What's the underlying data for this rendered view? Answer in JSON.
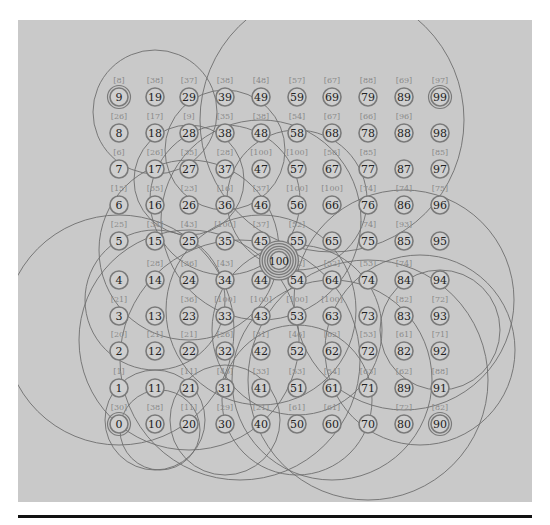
{
  "figure": {
    "background": "#c9c9c9",
    "line_color": "#6e6e6e",
    "node_ring_color": "#7a7a7a",
    "label_color": "#8a8a8a",
    "text_color": "#222222",
    "center_node": {
      "id": "100",
      "col": 4.5,
      "row": 4.5,
      "rings": 4
    },
    "double_ring_nodes": [
      "9",
      "99",
      "0",
      "90"
    ],
    "columns_x": [
      119,
      155,
      189,
      225,
      261,
      297,
      332,
      368,
      404,
      440
    ],
    "rows_y": [
      424,
      388,
      351,
      316,
      280,
      241,
      205,
      169,
      133,
      97
    ],
    "nodes": [
      {
        "id": "9",
        "col": 0,
        "row": 9,
        "label": "[8]"
      },
      {
        "id": "19",
        "col": 1,
        "row": 9,
        "label": "[38]"
      },
      {
        "id": "29",
        "col": 2,
        "row": 9,
        "label": "[37]"
      },
      {
        "id": "39",
        "col": 3,
        "row": 9,
        "label": "[38]"
      },
      {
        "id": "49",
        "col": 4,
        "row": 9,
        "label": "[48]"
      },
      {
        "id": "59",
        "col": 5,
        "row": 9,
        "label": "[57]"
      },
      {
        "id": "69",
        "col": 6,
        "row": 9,
        "label": "[67]"
      },
      {
        "id": "79",
        "col": 7,
        "row": 9,
        "label": "[88]"
      },
      {
        "id": "89",
        "col": 8,
        "row": 9,
        "label": "[69]"
      },
      {
        "id": "99",
        "col": 9,
        "row": 9,
        "label": "[97]"
      },
      {
        "id": "8",
        "col": 0,
        "row": 8,
        "label": "[26]"
      },
      {
        "id": "18",
        "col": 1,
        "row": 8,
        "label": "[17]"
      },
      {
        "id": "28",
        "col": 2,
        "row": 8,
        "label": "[9]"
      },
      {
        "id": "38",
        "col": 3,
        "row": 8,
        "label": "[35]"
      },
      {
        "id": "48",
        "col": 4,
        "row": 8,
        "label": "[38]"
      },
      {
        "id": "58",
        "col": 5,
        "row": 8,
        "label": "[54]"
      },
      {
        "id": "68",
        "col": 6,
        "row": 8,
        "label": "[67]"
      },
      {
        "id": "78",
        "col": 7,
        "row": 8,
        "label": "[66]"
      },
      {
        "id": "88",
        "col": 8,
        "row": 8,
        "label": "[96]"
      },
      {
        "id": "98",
        "col": 9,
        "row": 8,
        "label": ""
      },
      {
        "id": "7",
        "col": 0,
        "row": 7,
        "label": "[6]"
      },
      {
        "id": "17",
        "col": 1,
        "row": 7,
        "label": "[26]"
      },
      {
        "id": "27",
        "col": 2,
        "row": 7,
        "label": "[35]"
      },
      {
        "id": "37",
        "col": 3,
        "row": 7,
        "label": "[28]"
      },
      {
        "id": "47",
        "col": 4,
        "row": 7,
        "label": "[100]"
      },
      {
        "id": "57",
        "col": 5,
        "row": 7,
        "label": "[100]"
      },
      {
        "id": "67",
        "col": 6,
        "row": 7,
        "label": "[56]"
      },
      {
        "id": "77",
        "col": 7,
        "row": 7,
        "label": "[85]"
      },
      {
        "id": "87",
        "col": 8,
        "row": 7,
        "label": ""
      },
      {
        "id": "97",
        "col": 9,
        "row": 7,
        "label": "[85]"
      },
      {
        "id": "6",
        "col": 0,
        "row": 6,
        "label": "[15]"
      },
      {
        "id": "16",
        "col": 1,
        "row": 6,
        "label": "[35]"
      },
      {
        "id": "26",
        "col": 2,
        "row": 6,
        "label": "[23]"
      },
      {
        "id": "36",
        "col": 3,
        "row": 6,
        "label": "[16]"
      },
      {
        "id": "46",
        "col": 4,
        "row": 6,
        "label": "[37]"
      },
      {
        "id": "56",
        "col": 5,
        "row": 6,
        "label": "[100]"
      },
      {
        "id": "66",
        "col": 6,
        "row": 6,
        "label": "[100]"
      },
      {
        "id": "76",
        "col": 7,
        "row": 6,
        "label": "[74]"
      },
      {
        "id": "86",
        "col": 8,
        "row": 6,
        "label": "[74]"
      },
      {
        "id": "96",
        "col": 9,
        "row": 6,
        "label": "[75]"
      },
      {
        "id": "5",
        "col": 0,
        "row": 5,
        "label": "[25]"
      },
      {
        "id": "15",
        "col": 1,
        "row": 5,
        "label": "[34]"
      },
      {
        "id": "25",
        "col": 2,
        "row": 5,
        "label": "[43]"
      },
      {
        "id": "35",
        "col": 3,
        "row": 5,
        "label": "[100]"
      },
      {
        "id": "45",
        "col": 4,
        "row": 5,
        "label": "[37]"
      },
      {
        "id": "55",
        "col": 5,
        "row": 5,
        "label": "[52]"
      },
      {
        "id": "65",
        "col": 6,
        "row": 5,
        "label": ""
      },
      {
        "id": "75",
        "col": 7,
        "row": 5,
        "label": "[74]"
      },
      {
        "id": "85",
        "col": 8,
        "row": 5,
        "label": "[93]"
      },
      {
        "id": "95",
        "col": 9,
        "row": 5,
        "label": ""
      },
      {
        "id": "4",
        "col": 0,
        "row": 4,
        "label": ""
      },
      {
        "id": "14",
        "col": 1,
        "row": 4,
        "label": "[28]"
      },
      {
        "id": "24",
        "col": 2,
        "row": 4,
        "label": "[36]"
      },
      {
        "id": "34",
        "col": 3,
        "row": 4,
        "label": "[43]"
      },
      {
        "id": "44",
        "col": 4,
        "row": 4,
        "label": ""
      },
      {
        "id": "54",
        "col": 5,
        "row": 4,
        "label": "[52]"
      },
      {
        "id": "64",
        "col": 6,
        "row": 4,
        "label": "[52]"
      },
      {
        "id": "74",
        "col": 7,
        "row": 4,
        "label": "[53]"
      },
      {
        "id": "84",
        "col": 8,
        "row": 4,
        "label": "[74]"
      },
      {
        "id": "94",
        "col": 9,
        "row": 4,
        "label": ""
      },
      {
        "id": "3",
        "col": 0,
        "row": 3,
        "label": "[21]"
      },
      {
        "id": "13",
        "col": 1,
        "row": 3,
        "label": ""
      },
      {
        "id": "23",
        "col": 2,
        "row": 3,
        "label": "[36]"
      },
      {
        "id": "33",
        "col": 3,
        "row": 3,
        "label": "[100]"
      },
      {
        "id": "43",
        "col": 4,
        "row": 3,
        "label": "[100]"
      },
      {
        "id": "53",
        "col": 5,
        "row": 3,
        "label": "[100]"
      },
      {
        "id": "63",
        "col": 6,
        "row": 3,
        "label": "[100]"
      },
      {
        "id": "73",
        "col": 7,
        "row": 3,
        "label": ""
      },
      {
        "id": "83",
        "col": 8,
        "row": 3,
        "label": "[82]"
      },
      {
        "id": "93",
        "col": 9,
        "row": 3,
        "label": "[72]"
      },
      {
        "id": "2",
        "col": 0,
        "row": 2,
        "label": "[20]"
      },
      {
        "id": "12",
        "col": 1,
        "row": 2,
        "label": "[21]"
      },
      {
        "id": "22",
        "col": 2,
        "row": 2,
        "label": "[21]"
      },
      {
        "id": "32",
        "col": 3,
        "row": 2,
        "label": "[26]"
      },
      {
        "id": "42",
        "col": 4,
        "row": 2,
        "label": "[31]"
      },
      {
        "id": "52",
        "col": 5,
        "row": 2,
        "label": "[46]"
      },
      {
        "id": "62",
        "col": 6,
        "row": 2,
        "label": "[62]"
      },
      {
        "id": "72",
        "col": 7,
        "row": 2,
        "label": "[53]"
      },
      {
        "id": "82",
        "col": 8,
        "row": 2,
        "label": "[61]"
      },
      {
        "id": "92",
        "col": 9,
        "row": 2,
        "label": "[71]"
      },
      {
        "id": "1",
        "col": 0,
        "row": 1,
        "label": "[1]"
      },
      {
        "id": "11",
        "col": 1,
        "row": 1,
        "label": ""
      },
      {
        "id": "21",
        "col": 2,
        "row": 1,
        "label": "[11]"
      },
      {
        "id": "31",
        "col": 3,
        "row": 1,
        "label": "[43]"
      },
      {
        "id": "41",
        "col": 4,
        "row": 1,
        "label": "[33]"
      },
      {
        "id": "51",
        "col": 5,
        "row": 1,
        "label": "[53]"
      },
      {
        "id": "61",
        "col": 6,
        "row": 1,
        "label": "[54]"
      },
      {
        "id": "71",
        "col": 7,
        "row": 1,
        "label": "[63]"
      },
      {
        "id": "89",
        "col": 8,
        "row": 1,
        "label": "[62]"
      },
      {
        "id": "91",
        "col": 9,
        "row": 1,
        "label": "[88]"
      },
      {
        "id": "0",
        "col": 0,
        "row": 0,
        "label": "[30]"
      },
      {
        "id": "10",
        "col": 1,
        "row": 0,
        "label": "[38]"
      },
      {
        "id": "20",
        "col": 2,
        "row": 0,
        "label": "[11]"
      },
      {
        "id": "30",
        "col": 3,
        "row": 0,
        "label": "[29]"
      },
      {
        "id": "40",
        "col": 4,
        "row": 0,
        "label": "[21]"
      },
      {
        "id": "50",
        "col": 5,
        "row": 0,
        "label": "[61]"
      },
      {
        "id": "60",
        "col": 6,
        "row": 0,
        "label": "[61]"
      },
      {
        "id": "70",
        "col": 7,
        "row": 0,
        "label": ""
      },
      {
        "id": "80",
        "col": 8,
        "row": 0,
        "label": "[72]"
      },
      {
        "id": "90",
        "col": 9,
        "row": 0,
        "label": "[82]"
      }
    ],
    "circles": [
      {
        "cx": 155,
        "cy": 112,
        "r": 62
      },
      {
        "cx": 332,
        "cy": 120,
        "r": 132
      },
      {
        "cx": 119,
        "cy": 330,
        "r": 115
      },
      {
        "cx": 225,
        "cy": 200,
        "r": 75
      },
      {
        "cx": 189,
        "cy": 250,
        "r": 90
      },
      {
        "cx": 261,
        "cy": 220,
        "r": 100
      },
      {
        "cx": 225,
        "cy": 150,
        "r": 60
      },
      {
        "cx": 189,
        "cy": 340,
        "r": 110
      },
      {
        "cx": 297,
        "cy": 330,
        "r": 85
      },
      {
        "cx": 155,
        "cy": 300,
        "r": 70
      },
      {
        "cx": 261,
        "cy": 310,
        "r": 95
      },
      {
        "cx": 404,
        "cy": 300,
        "r": 110
      },
      {
        "cx": 440,
        "cy": 330,
        "r": 60
      },
      {
        "cx": 420,
        "cy": 350,
        "r": 95
      },
      {
        "cx": 155,
        "cy": 420,
        "r": 50
      },
      {
        "cx": 160,
        "cy": 430,
        "r": 40
      },
      {
        "cx": 225,
        "cy": 420,
        "r": 55
      },
      {
        "cx": 297,
        "cy": 400,
        "r": 75
      },
      {
        "cx": 332,
        "cy": 380,
        "r": 100
      },
      {
        "cx": 368,
        "cy": 380,
        "r": 120
      },
      {
        "cx": 240,
        "cy": 360,
        "r": 120
      },
      {
        "cx": 297,
        "cy": 200,
        "r": 70
      },
      {
        "cx": 189,
        "cy": 180,
        "r": 55
      }
    ]
  },
  "footer_rule": {
    "visible": true
  }
}
